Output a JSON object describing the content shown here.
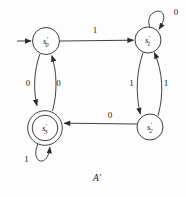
{
  "diagram": {
    "type": "finite-state-automaton",
    "caption": "A′",
    "states": {
      "s0": {
        "letter": "s",
        "prime": "′",
        "sub": "0",
        "start": true,
        "accepting": false
      },
      "s1": {
        "letter": "s",
        "prime": "′",
        "sub": "1",
        "start": false,
        "accepting": false
      },
      "s2": {
        "letter": "s",
        "prime": "′",
        "sub": "2",
        "start": false,
        "accepting": false
      },
      "s3": {
        "letter": "s",
        "prime": "′",
        "sub": "3",
        "start": false,
        "accepting": true
      }
    },
    "edges": {
      "s0_to_s1": {
        "label": "1"
      },
      "s1_self": {
        "label": "0"
      },
      "s0_to_s3": {
        "label": "0"
      },
      "s3_to_s0": {
        "label": "0"
      },
      "s1_to_s2": {
        "label": "1"
      },
      "s2_to_s1": {
        "label": "1"
      },
      "s2_to_s3": {
        "label": "0"
      },
      "s3_self": {
        "label": "1"
      }
    },
    "colors": {
      "line": "#2b2b2b",
      "text": "#222222",
      "background": "#fdfdfd"
    }
  }
}
